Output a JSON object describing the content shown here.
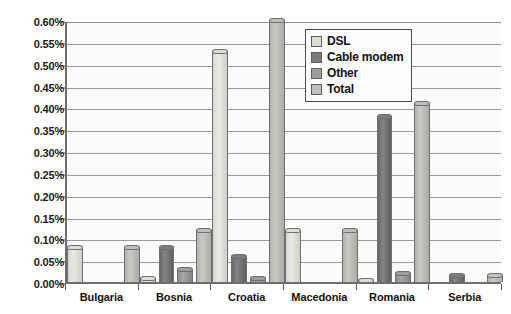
{
  "chart_data": {
    "type": "bar",
    "title": "",
    "subtitle": "",
    "xlabel": "",
    "ylabel": "",
    "categories": [
      "Bulgaria",
      "Bosnia",
      "Croatia",
      "Macedonia",
      "Romania",
      "Serbia"
    ],
    "series": [
      {
        "name": "DSL",
        "color": "#dedeD9",
        "values": [
          0.08,
          0.01,
          0.53,
          0.12,
          0.005,
          0.0
        ]
      },
      {
        "name": "Cable modem",
        "color": "#7c7c7c",
        "values": [
          0.0,
          0.08,
          0.06,
          0.0,
          0.38,
          0.015
        ]
      },
      {
        "name": "Other",
        "color": "#9d9d9d",
        "values": [
          0.0,
          0.03,
          0.01,
          0.0,
          0.02,
          0.0
        ]
      },
      {
        "name": "Total",
        "color": "#c0c0bc",
        "values": [
          0.08,
          0.12,
          0.6,
          0.12,
          0.41,
          0.015
        ]
      }
    ],
    "ylim": [
      0,
      0.6
    ],
    "ytick_values": [
      0.0,
      0.05,
      0.1,
      0.15,
      0.2,
      0.25,
      0.3,
      0.35,
      0.4,
      0.45,
      0.5,
      0.55,
      0.6
    ],
    "ytick_labels": [
      "0.00%",
      "0.05%",
      "0.10%",
      "0.15%",
      "0.20%",
      "0.25%",
      "0.30%",
      "0.35%",
      "0.40%",
      "0.45%",
      "0.50%",
      "0.55%",
      "0.60%"
    ],
    "value_unit": "%",
    "grid": true,
    "grid_axis": "y",
    "legend_position": "top-right",
    "legend_entries": [
      "DSL",
      "Cable modem",
      "Other",
      "Total"
    ]
  }
}
